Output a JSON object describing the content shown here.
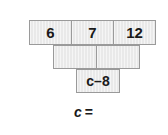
{
  "diagram": {
    "type": "number-pyramid",
    "title": "",
    "rows": [
      {
        "name": "top-row",
        "cells": [
          {
            "value": "6",
            "empty": false
          },
          {
            "value": "7",
            "empty": false
          },
          {
            "value": "12",
            "empty": false
          }
        ]
      },
      {
        "name": "middle-row",
        "cells": [
          {
            "value": "",
            "empty": true
          },
          {
            "value": "",
            "empty": true
          }
        ]
      },
      {
        "name": "bottom-row",
        "cells": [
          {
            "value": "c–8",
            "empty": false
          }
        ]
      }
    ]
  },
  "answer_prompt": {
    "variable": "c",
    "equals": "=",
    "text": "c ="
  },
  "colors": {
    "background": "#ffffff",
    "cell_fill": "#e9e9e9",
    "cell_border": "#9a9a9a",
    "text": "#1a1a1a"
  }
}
